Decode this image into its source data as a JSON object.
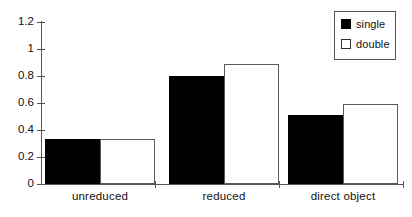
{
  "chart_data": {
    "type": "bar",
    "title": "",
    "subtitle": "",
    "xlabel": "",
    "ylabel": "",
    "categories": [
      "unreduced",
      "reduced",
      "direct object"
    ],
    "series": [
      {
        "name": "single",
        "color": "#000000",
        "fill": "solid",
        "values": [
          0.33,
          0.8,
          0.51
        ]
      },
      {
        "name": "double",
        "color": "#ffffff",
        "fill": "hollow",
        "values": [
          0.33,
          0.89,
          0.59
        ]
      }
    ],
    "ylim": [
      0,
      1.2
    ],
    "yticks": [
      0,
      0.2,
      0.4,
      0.6,
      0.8,
      1,
      1.2
    ],
    "ytick_labels": [
      "0",
      "0.2",
      "0.4",
      "0.6",
      "0.8",
      "1",
      "1.2"
    ],
    "grid": false,
    "legend": {
      "position": "top-right",
      "border": true,
      "entries": [
        {
          "label": "single",
          "swatch": "filled"
        },
        {
          "label": "double",
          "swatch": "hollow"
        }
      ]
    },
    "axis_color": "#555555",
    "text_color": "#111111",
    "background": "#ffffff"
  }
}
